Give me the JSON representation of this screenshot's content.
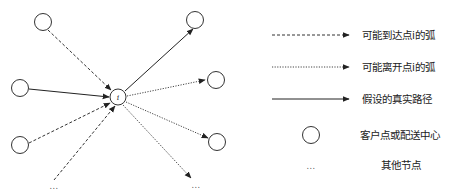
{
  "diagram": {
    "center_node": {
      "label": "i"
    },
    "outer_node_count_left": 3,
    "outer_node_count_right": 3,
    "other_nodes_marker": "...",
    "arcs": [
      {
        "from": "top-left-node",
        "to": "i",
        "type": "possible-arrival"
      },
      {
        "from": "middle-left-node",
        "to": "i",
        "type": "assumed-real-path"
      },
      {
        "from": "bottom-left-node",
        "to": "i",
        "type": "possible-arrival"
      },
      {
        "from": "other-nodes-left",
        "to": "i",
        "type": "possible-arrival"
      },
      {
        "from": "i",
        "to": "top-right-node",
        "type": "assumed-real-path"
      },
      {
        "from": "i",
        "to": "middle-right-node",
        "type": "possible-departure"
      },
      {
        "from": "i",
        "to": "lower-right-node",
        "type": "possible-departure"
      },
      {
        "from": "i",
        "to": "other-nodes-right",
        "type": "possible-departure"
      }
    ]
  },
  "legend": {
    "items": [
      {
        "symbol": "dashed-arrow",
        "label": "可能到达点i的弧"
      },
      {
        "symbol": "dotted-arrow",
        "label": "可能离开点i的弧"
      },
      {
        "symbol": "solid-arrow",
        "label": "假设的真实路径"
      },
      {
        "symbol": "circle",
        "label": "客户点或配送中心"
      },
      {
        "symbol": "ellipsis",
        "label": "其他节点",
        "marker": "..."
      }
    ]
  }
}
